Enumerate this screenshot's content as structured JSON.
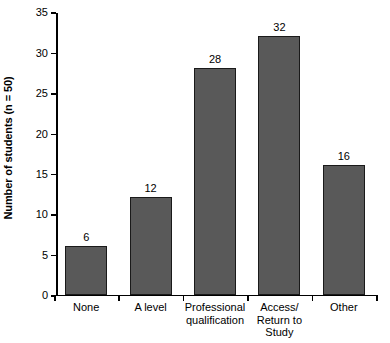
{
  "chart_data": {
    "type": "bar",
    "title": "",
    "xlabel": "",
    "ylabel": "Number of students (n = 50)",
    "categories": [
      "None",
      "A level",
      "Professional\nqualification",
      "Access/\nReturn to\nStudy",
      "Other"
    ],
    "values": [
      6,
      12,
      28,
      32,
      16
    ],
    "value_labels": [
      "6",
      "12",
      "28",
      "32",
      "16"
    ],
    "ylim": [
      0,
      35
    ],
    "yticks": [
      0,
      5,
      10,
      15,
      20,
      25,
      30,
      35
    ],
    "ytick_labels": [
      "0",
      "5",
      "10",
      "15",
      "20",
      "25",
      "30",
      "35"
    ],
    "grid": false,
    "legend": null,
    "colors": {
      "bar_fill": "#595959",
      "bar_edge": "#1a1a1a",
      "axis": "#000000",
      "background": "#ffffff",
      "text": "#000000"
    }
  }
}
